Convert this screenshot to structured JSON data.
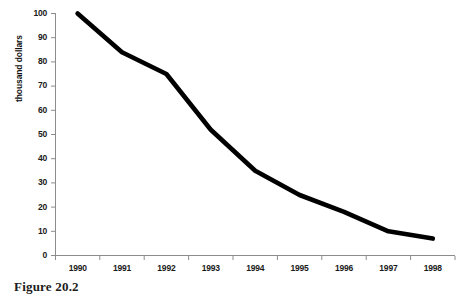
{
  "figure": {
    "caption": "Figure 20.2"
  },
  "chart_data": {
    "type": "line",
    "title": "",
    "subtitle": "",
    "xlabel": "",
    "ylabel": "thousand dollars",
    "x": [
      "1990",
      "1991",
      "1992",
      "1993",
      "1994",
      "1995",
      "1996",
      "1997",
      "1998"
    ],
    "categories": [
      "1990",
      "1991",
      "1992",
      "1993",
      "1994",
      "1995",
      "1996",
      "1997",
      "1998"
    ],
    "values": [
      100,
      84,
      75,
      52,
      35,
      25,
      18,
      10,
      7
    ],
    "series": [
      {
        "name": "thousand dollars",
        "values": [
          100,
          84,
          75,
          52,
          35,
          25,
          18,
          10,
          7
        ],
        "color": "#000000"
      }
    ],
    "ylim": [
      0,
      100
    ],
    "ytick_labels": [
      "100",
      "90",
      "80",
      "70",
      "60",
      "50",
      "40",
      "30",
      "20",
      "10",
      "0"
    ],
    "ytick_values": [
      100,
      90,
      80,
      70,
      60,
      50,
      40,
      30,
      20,
      10,
      0
    ],
    "xtick_labels": [
      "1990",
      "1991",
      "1992",
      "1993",
      "1994",
      "1995",
      "1996",
      "1997",
      "1998"
    ],
    "grid": false,
    "legend": false,
    "legend_position": "none",
    "line_color": "#000000",
    "axis_color": "#808080"
  }
}
